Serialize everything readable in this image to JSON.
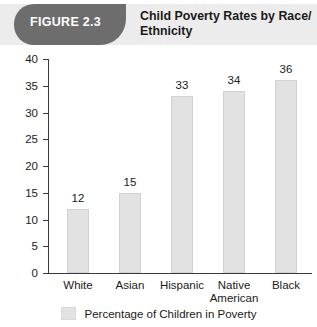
{
  "figure": {
    "banner_label": "FIGURE 2.3",
    "title": "Child Poverty Rates by Race/ Ethnicity",
    "banner_color": "#6d6d6d",
    "header_background": "#ececec"
  },
  "chart_data": {
    "type": "bar",
    "title": "Child Poverty Rates by Race/ Ethnicity",
    "categories": [
      "White",
      "Asian",
      "Hispanic",
      "Native American",
      "Black"
    ],
    "values": [
      12,
      15,
      33,
      34,
      36
    ],
    "value_labels": [
      "12",
      "15",
      "33",
      "34",
      "36"
    ],
    "xlabel": "",
    "ylabel": "",
    "ylim": [
      0,
      40
    ],
    "ytick_labels": [
      "0",
      "5",
      "10",
      "15",
      "20",
      "25",
      "30",
      "35",
      "40"
    ],
    "ytick_values": [
      0,
      5,
      10,
      15,
      20,
      25,
      30,
      35,
      40
    ],
    "grid": false,
    "legend": {
      "position": "bottom",
      "entries": [
        {
          "label": "Percentage of Children in Poverty",
          "color": "#e2e2e2"
        }
      ]
    },
    "bar_color": "#e2e2e2",
    "axis_color": "#3a3a3a"
  }
}
